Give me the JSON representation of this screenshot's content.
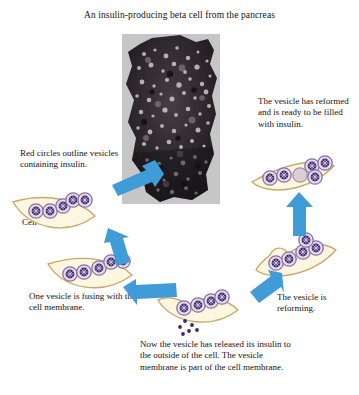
{
  "figure": {
    "title": "An insulin-producing beta cell from the pancreas",
    "background_color": "#ffffff",
    "arrow_color": "#3f9cd9",
    "membrane_color": "#fdf6e0",
    "membrane_stroke": "#c9a96a",
    "vesicle_fill": "#e8dcec",
    "vesicle_stroke": "#8e6f9e",
    "granule_color": "#3b2a6b",
    "empty_vesicle_fill": "#d9cfd6"
  },
  "micrograph": {
    "name": "beta-cell-electron-micrograph",
    "description": "Dark granular electron micrograph of a beta cell"
  },
  "captions": {
    "red_circles": "Red circles outline vesicles containing insulin.",
    "cell_membrane": "Cell membrane",
    "vesicle_reformed": "The vesicle has reformed and is ready to be filled with insulin.",
    "vesicle_fusing": "One vesicle is fusing with the cell membrane.",
    "insulin_released": "Now the vesicle has released its insulin to the outside of the cell. The vesicle membrane is part of the cell membrane.",
    "vesicle_reforming": "The vesicle is reforming."
  },
  "arrows": [
    {
      "name": "arrow-to-start",
      "direction": "down-left"
    },
    {
      "name": "arrow-to-fusing",
      "direction": "down-right"
    },
    {
      "name": "arrow-to-released",
      "direction": "right"
    },
    {
      "name": "arrow-to-reforming",
      "direction": "up-right"
    },
    {
      "name": "arrow-to-reformed",
      "direction": "up"
    }
  ],
  "stages": [
    {
      "name": "stage-vesicles-containing-insulin",
      "vesicles": 5,
      "empty_vesicles": 0
    },
    {
      "name": "stage-vesicle-fusing",
      "vesicles": 5,
      "empty_vesicles": 0
    },
    {
      "name": "stage-insulin-released",
      "vesicles": 4,
      "empty_vesicles": 0,
      "free_granules": 6
    },
    {
      "name": "stage-vesicle-reforming",
      "vesicles": 5,
      "empty_vesicles": 0
    },
    {
      "name": "stage-vesicle-reformed",
      "vesicles": 4,
      "empty_vesicles": 1
    }
  ]
}
